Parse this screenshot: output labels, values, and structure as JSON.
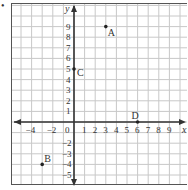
{
  "bullet": "•",
  "axes": {
    "x_label": "x",
    "y_label": "y",
    "origin_label": "0",
    "x_ticks": [
      "-4",
      "-2",
      "1",
      "2",
      "3",
      "4",
      "5",
      "6",
      "7",
      "8",
      "9"
    ],
    "y_ticks": [
      "9",
      "8",
      "7",
      "6",
      "5",
      "4",
      "3",
      "2",
      "1",
      "-2",
      "-3",
      "-4",
      "-5"
    ]
  },
  "points": [
    {
      "label": "A",
      "x": 3,
      "y": 9
    },
    {
      "label": "B",
      "x": -3,
      "y": -4
    },
    {
      "label": "C",
      "x": 0,
      "y": 5
    },
    {
      "label": "D",
      "x": 6,
      "y": 0
    }
  ],
  "colors": {
    "grid": "#c8c8c8",
    "axis": "#333333",
    "frame": "#555555"
  }
}
